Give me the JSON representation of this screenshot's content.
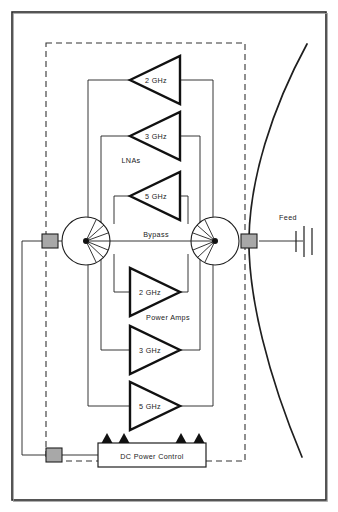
{
  "figure": {
    "border_color": "#2b2b2b",
    "line_color": "#1f1f1f",
    "connector_fill": "#a8a8a8",
    "dashed_color": "#333333"
  },
  "labels": {
    "lnas": "LNAs",
    "power_amps": "Power Amps",
    "bypass": "Bypass",
    "feed": "Feed",
    "dc_power_control": "DC Power Control"
  },
  "lna_chain": {
    "group_label": "LNAs",
    "direction": "left",
    "stages": [
      {
        "band": "2 GHz"
      },
      {
        "band": "3 GHz"
      },
      {
        "band": "5 GHz"
      }
    ]
  },
  "pa_chain": {
    "group_label": "Power Amps",
    "direction": "right",
    "stages": [
      {
        "band": "2 GHz"
      },
      {
        "band": "3 GHz"
      },
      {
        "band": "5 GHz"
      }
    ]
  },
  "switches": [
    {
      "name": "input-rotary-switch",
      "poles": 8
    },
    {
      "name": "output-rotary-switch",
      "poles": 8
    }
  ],
  "connectors": [
    {
      "name": "rf-input-connector"
    },
    {
      "name": "feed-connector"
    },
    {
      "name": "dc-input-connector"
    }
  ],
  "dc_power_control": {
    "label": "DC Power Control",
    "bias_arrows": 4
  },
  "antenna": {
    "feed_label": "Feed",
    "reflector": "parabolic"
  }
}
